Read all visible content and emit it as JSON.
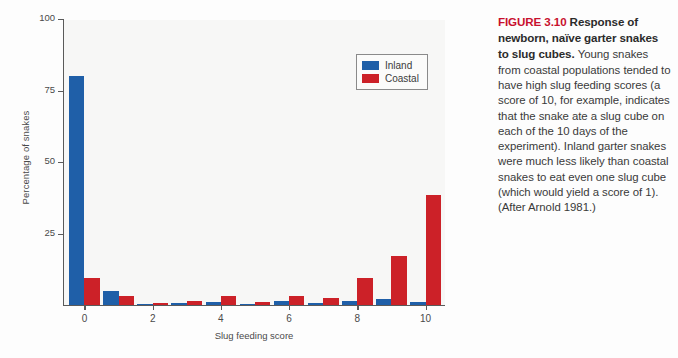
{
  "figure": {
    "caption_figure_number": "FIGURE 3.10",
    "caption_title": " Response of newborn, naïve garter snakes to slug cubes.",
    "caption_body": "Young snakes from coastal populations tended to have high slug feeding scores (a score of 10, for example, indicates that the snake ate a slug cube on each of the 10 days of the experiment). Inland garter snakes were much less likely than coastal snakes to eat even one slug cube (which would yield a score of 1). (After Arnold 1981.)",
    "accent_color": "#c8102e"
  },
  "colors": {
    "inland": "#1f5fa8",
    "coastal": "#cc2128",
    "axis": "#5a5a5a",
    "plot_background": "#f7f7f6",
    "page_background": "#fdfdfd"
  },
  "chart_data": {
    "type": "bar",
    "title": "",
    "xlabel": "Slug feeding score",
    "ylabel": "Percentage of snakes",
    "categories": [
      "0",
      "1",
      "2",
      "3",
      "4",
      "5",
      "6",
      "7",
      "8",
      "9",
      "10"
    ],
    "x": [
      0,
      1,
      2,
      3,
      4,
      5,
      6,
      7,
      8,
      9,
      10
    ],
    "series": [
      {
        "name": "Inland",
        "color": "#1f5fa8",
        "values": [
          80,
          5,
          0.3,
          0.8,
          1.2,
          0.3,
          1.3,
          0.6,
          1.4,
          2,
          1
        ]
      },
      {
        "name": "Coastal",
        "color": "#cc2128",
        "values": [
          9.5,
          3.2,
          0.8,
          1.5,
          3.3,
          0.9,
          3.2,
          2.3,
          9.5,
          17,
          38.5
        ]
      }
    ],
    "ylim": [
      0,
      100
    ],
    "yticks": [
      0,
      25,
      50,
      75,
      100
    ],
    "ytick_labels": [
      "",
      "25",
      "50",
      "75",
      "100"
    ],
    "xlim": [
      -0.6,
      10.6
    ],
    "xticks": [
      0,
      2,
      4,
      6,
      8,
      10
    ],
    "xtick_labels": [
      "0",
      "2",
      "4",
      "6",
      "8",
      "10"
    ],
    "grid": false,
    "legend_position": "top-right",
    "legend_entries": [
      "Inland",
      "Coastal"
    ]
  }
}
